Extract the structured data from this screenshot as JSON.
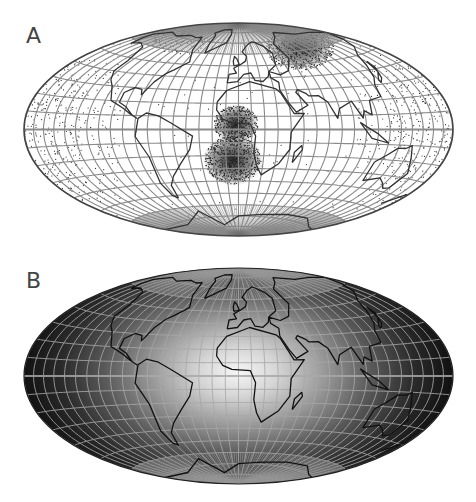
{
  "figure": {
    "panels": [
      {
        "id": "A",
        "label": "A",
        "projection": "Hammer/Aitoff-style equal-area ellipse (oblique, centered on Atlantic/Africa)",
        "style": "point-density (scatter dots over white background)",
        "description": "World map with graticule; dense point clusters over central Africa/Gulf of Guinea, South Atlantic, and northern Russia; diffuse sparse points toward the antipodal (Pacific) edges",
        "colors": {
          "background": "#ffffff",
          "graticule": "#8a8a8a",
          "coastline": "#333333",
          "outline": "#444444",
          "points": "#333333"
        }
      },
      {
        "id": "B",
        "label": "B",
        "projection": "Hammer/Aitoff-style equal-area ellipse (oblique, same as A)",
        "style": "radial grayscale gradient (bright center, dark edges)",
        "description": "Same world map with graticule drawn in light gray over a grayscale field that is brightest near the center (Africa) and darkens toward the ellipse edges",
        "colors": {
          "center": "#f4f4f4",
          "mid": "#7a7a7a",
          "edge": "#141414",
          "graticule": "#a8a8a8",
          "coastline": "#111111"
        }
      }
    ]
  }
}
